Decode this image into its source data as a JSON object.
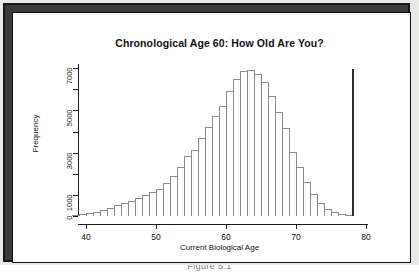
{
  "figure": {
    "caption": "Figure 5.1"
  },
  "chart_data": {
    "type": "bar",
    "title": "Chronological Age 60: How Old Are You?",
    "xlabel": "Current Biological Age",
    "ylabel": "Frequency",
    "xlim": [
      38,
      80
    ],
    "ylim": [
      0,
      7200
    ],
    "grid": false,
    "legend": null,
    "xticks": [
      40,
      50,
      60,
      70,
      80
    ],
    "xtick_labels": [
      "40",
      "50",
      "60",
      "70",
      "80"
    ],
    "yticks": [
      0,
      1000,
      2000,
      3000,
      4000,
      5000,
      6000,
      7000
    ],
    "ytick_labels": [
      "0",
      "1000",
      "",
      "3000",
      "",
      "5000",
      "",
      "7000"
    ],
    "bin_width": 1,
    "categories": [
      38,
      39,
      40,
      41,
      42,
      43,
      44,
      45,
      46,
      47,
      48,
      49,
      50,
      51,
      52,
      53,
      54,
      55,
      56,
      57,
      58,
      59,
      60,
      61,
      62,
      63,
      64,
      65,
      66,
      67,
      68,
      69,
      70,
      71,
      72,
      73,
      74,
      75,
      76,
      77
    ],
    "values": [
      60,
      110,
      160,
      210,
      290,
      380,
      520,
      620,
      720,
      840,
      980,
      1130,
      1300,
      1560,
      1880,
      2300,
      2850,
      3150,
      3700,
      4200,
      4750,
      5200,
      5900,
      6500,
      6880,
      6900,
      6750,
      6350,
      5700,
      4950,
      4150,
      3050,
      2300,
      1600,
      1060,
      600,
      330,
      180,
      90,
      40
    ],
    "annotations": [
      {
        "type": "vline",
        "x": 78,
        "label": "",
        "color": "#2a2a2a"
      }
    ]
  }
}
